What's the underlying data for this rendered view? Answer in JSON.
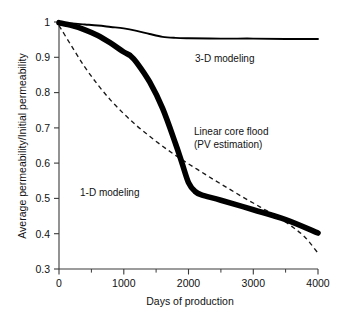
{
  "chart_data": {
    "type": "line",
    "title": "",
    "xlabel": "Days of production",
    "ylabel": "Average permeability/Initial permeability",
    "xlim": [
      0,
      4000
    ],
    "ylim": [
      0.3,
      1.0
    ],
    "grid": false,
    "legend_position": "inline-annotations",
    "x_ticks": [
      "0",
      "1000",
      "2000",
      "3000",
      "4000"
    ],
    "x_tick_values": [
      0,
      1000,
      2000,
      3000,
      4000
    ],
    "x_minor_tick_values": [
      500,
      1500,
      2500,
      3500
    ],
    "y_ticks": [
      "0.3",
      "0.4",
      "0.5",
      "0.6",
      "0.7",
      "0.8",
      "0.9",
      "1"
    ],
    "y_tick_values": [
      0.3,
      0.4,
      0.5,
      0.6,
      0.7,
      0.8,
      0.9,
      1.0
    ],
    "series": [
      {
        "name": "3-D modeling",
        "style": "thin-solid",
        "color": "#000000",
        "x": [
          0,
          200,
          400,
          600,
          800,
          1000,
          1200,
          1400,
          1600,
          1800,
          2000,
          2500,
          3000,
          3500,
          4000
        ],
        "values": [
          0.998,
          0.996,
          0.993,
          0.99,
          0.986,
          0.982,
          0.975,
          0.966,
          0.958,
          0.955,
          0.954,
          0.953,
          0.953,
          0.952,
          0.952
        ]
      },
      {
        "name": "Linear core flood (PV estimation)",
        "style": "thick-solid",
        "color": "#000000",
        "x": [
          0,
          200,
          400,
          600,
          800,
          1000,
          1100,
          1200,
          1400,
          1600,
          1800,
          1900,
          2000,
          2100,
          2200,
          2500,
          3000,
          3500,
          4000
        ],
        "values": [
          0.998,
          0.99,
          0.978,
          0.962,
          0.94,
          0.915,
          0.905,
          0.885,
          0.83,
          0.755,
          0.655,
          0.6,
          0.545,
          0.52,
          0.51,
          0.495,
          0.468,
          0.44,
          0.402
        ]
      },
      {
        "name": "1-D modeling",
        "style": "dashed",
        "color": "#1a1a1a",
        "x": [
          0,
          200,
          400,
          600,
          800,
          1000,
          1200,
          1400,
          1600,
          1800,
          2000,
          2200,
          2400,
          2600,
          2800,
          3000,
          3200,
          3400,
          3600,
          3800,
          4000
        ],
        "values": [
          0.99,
          0.93,
          0.872,
          0.822,
          0.778,
          0.74,
          0.706,
          0.676,
          0.648,
          0.622,
          0.598,
          0.575,
          0.552,
          0.53,
          0.508,
          0.487,
          0.466,
          0.445,
          0.42,
          0.39,
          0.345
        ]
      }
    ],
    "annotations": [
      {
        "id": "annot-3d",
        "text": "3-D modeling",
        "x": 2100,
        "y": 0.885
      },
      {
        "id": "annot-linear-1",
        "text": "Linear core flood",
        "x": 2150,
        "y": 0.695
      },
      {
        "id": "annot-linear-2",
        "text": "(PV estimation)",
        "x": 2150,
        "y": 0.655
      },
      {
        "id": "annot-1d",
        "text": "1-D modeling",
        "x": 500,
        "y": 0.545
      }
    ]
  },
  "axes": {
    "x_title": "Days of production",
    "y_title": "Average permeability/Initial permeability",
    "x_tick_0": "0",
    "x_tick_1": "1000",
    "x_tick_2": "2000",
    "x_tick_3": "3000",
    "x_tick_4": "4000",
    "y_tick_0": "0.3",
    "y_tick_1": "0.4",
    "y_tick_2": "0.5",
    "y_tick_3": "0.6",
    "y_tick_4": "0.7",
    "y_tick_5": "0.8",
    "y_tick_6": "0.9",
    "y_tick_7": "1"
  },
  "labels": {
    "three_d": "3-D modeling",
    "linear_line1": "Linear core flood",
    "linear_line2": "(PV estimation)",
    "one_d": "1-D modeling"
  },
  "colors": {
    "background": "#ffffff",
    "axis": "#3a3a3a",
    "curve": "#000000",
    "dashed_curve": "#1a1a1a",
    "text": "#111111"
  }
}
